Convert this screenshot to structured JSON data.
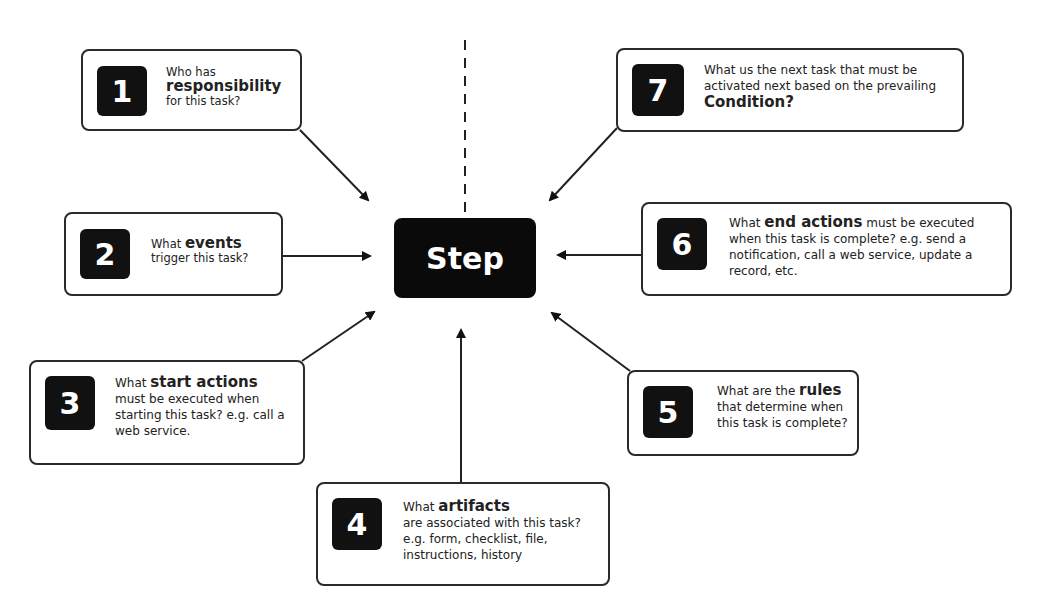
{
  "top_caption": "... question should be answered for each process step ...",
  "center": {
    "label": "Step"
  },
  "cards": [
    {
      "number": "1",
      "pre": "Who has",
      "bold": "responsibility",
      "post": "for this task?"
    },
    {
      "number": "2",
      "pre": "What",
      "bold": "events",
      "post": "trigger this task?"
    },
    {
      "number": "3",
      "pre": "What",
      "bold": "start actions",
      "post": "must be executed when starting this task? e.g. call a web service."
    },
    {
      "number": "4",
      "pre": "What",
      "bold": "artifacts",
      "post": "are associated with this task? e.g. form, checklist, file, instructions, history"
    },
    {
      "number": "5",
      "pre": "What are the",
      "bold": "rules",
      "post": "that determine when this task is complete?"
    },
    {
      "number": "6",
      "pre": "What",
      "bold": "end actions",
      "post": "must be executed when this task is complete? e.g. send a notification, call a web service, update a record, etc."
    },
    {
      "number": "7",
      "pre": "What us the next task that must be activated next based on the prevailing",
      "bold": "Condition?",
      "post": ""
    }
  ]
}
